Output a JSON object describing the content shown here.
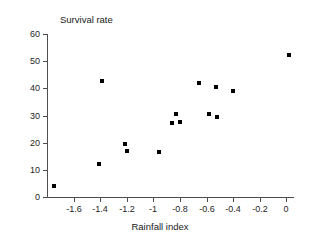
{
  "chart_data": {
    "type": "scatter",
    "title": "",
    "subtitle": "",
    "xlabel": "Rainfall index",
    "ylabel": "Survival rate",
    "xlim": [
      -1.8,
      0.05
    ],
    "ylim": [
      0,
      60
    ],
    "xticks": [
      -1.6,
      -1.4,
      -1.2,
      -1,
      -0.8,
      -0.6,
      -0.4,
      -0.2,
      0
    ],
    "xticklabels": [
      "-1.6",
      "-1.4",
      "-1.2",
      "-1",
      "-0.8",
      "-0.6",
      "-0.4",
      "-0.2",
      "0"
    ],
    "yticks": [
      0,
      10,
      20,
      30,
      40,
      50,
      60
    ],
    "yticklabels": [
      "0",
      "10",
      "20",
      "30",
      "40",
      "50",
      "60"
    ],
    "grid": false,
    "legend": false,
    "legend_position": "none",
    "marker": "square",
    "marker_color": "#000000",
    "series": [
      {
        "name": "Survival rate vs rainfall index",
        "points": [
          {
            "x": -1.75,
            "y": 4.0
          },
          {
            "x": -1.41,
            "y": 12.0
          },
          {
            "x": -1.39,
            "y": 42.8
          },
          {
            "x": -1.21,
            "y": 19.5
          },
          {
            "x": -1.2,
            "y": 17.0
          },
          {
            "x": -0.96,
            "y": 16.7
          },
          {
            "x": -0.86,
            "y": 27.2
          },
          {
            "x": -0.83,
            "y": 30.5
          },
          {
            "x": -0.8,
            "y": 27.6
          },
          {
            "x": -0.66,
            "y": 42.0
          },
          {
            "x": -0.58,
            "y": 30.7
          },
          {
            "x": -0.53,
            "y": 40.5
          },
          {
            "x": -0.52,
            "y": 29.5
          },
          {
            "x": -0.4,
            "y": 39.2
          },
          {
            "x": 0.02,
            "y": 52.3
          }
        ]
      }
    ]
  },
  "axes": {
    "y_title": "Survival rate",
    "x_title": "Rainfall index"
  },
  "colors": {
    "axis": "#4d4d4d",
    "text": "#262626",
    "marker": "#000000",
    "background": "#ffffff"
  }
}
